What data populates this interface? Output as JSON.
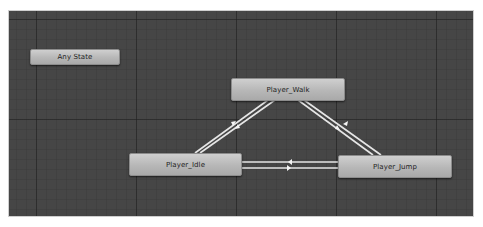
{
  "window": {
    "view": "Animator state machine graph"
  },
  "states": [
    {
      "id": "any_state",
      "label": "Any State",
      "kind": "any"
    },
    {
      "id": "player_walk",
      "label": "Player_Walk",
      "kind": "state"
    },
    {
      "id": "player_idle",
      "label": "Player_Idle",
      "kind": "state"
    },
    {
      "id": "player_jump",
      "label": "Player_Jump",
      "kind": "state"
    }
  ],
  "transitions": [
    {
      "from": "Player_Idle",
      "to": "Player_Walk"
    },
    {
      "from": "Player_Walk",
      "to": "Player_Idle"
    },
    {
      "from": "Player_Walk",
      "to": "Player_Jump"
    },
    {
      "from": "Player_Jump",
      "to": "Player_Walk"
    },
    {
      "from": "Player_Idle",
      "to": "Player_Jump"
    },
    {
      "from": "Player_Jump",
      "to": "Player_Idle"
    }
  ],
  "colors": {
    "canvas_bg": "#464646",
    "node_fill": "#b9b9b9",
    "transition_line": "#e6e6e6",
    "page_bg": "#ffffff"
  }
}
